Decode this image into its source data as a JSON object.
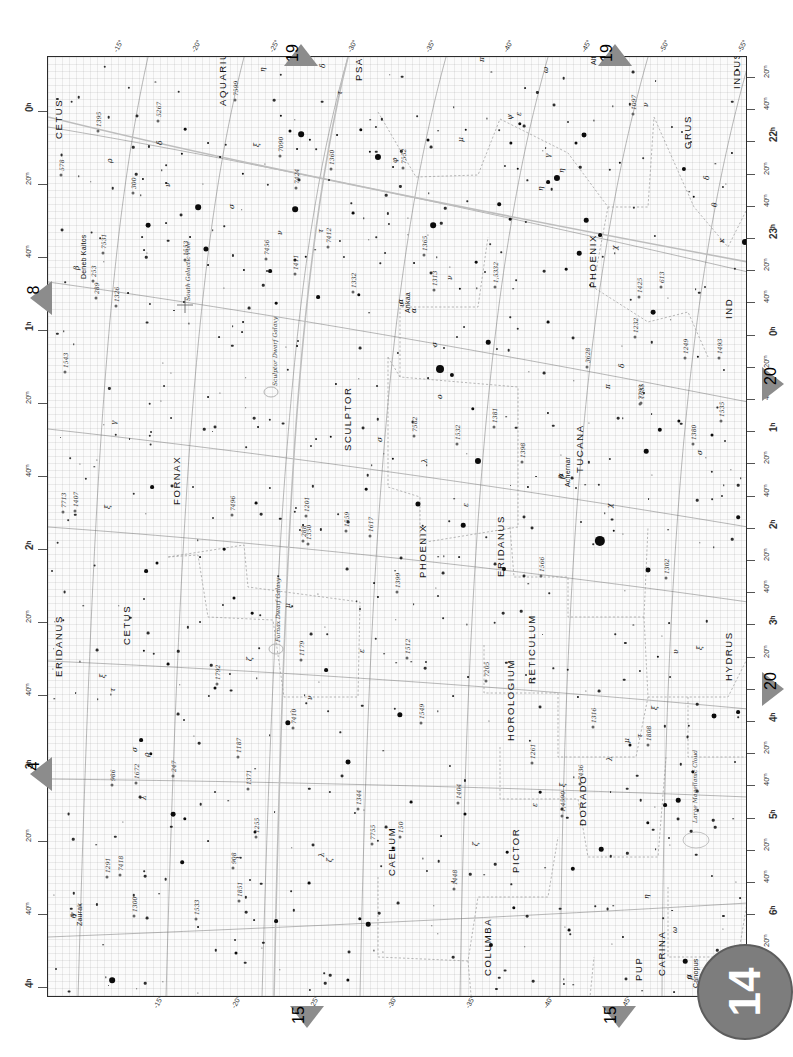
{
  "chart": {
    "page_number": "14",
    "type": "star-atlas-chart",
    "orientation_note": "labels rotated 90 degrees counter-clockwise",
    "frame": {
      "x": 47,
      "y": 56,
      "w": 700,
      "h": 941
    }
  },
  "axes": {
    "declination_label_top": [
      "-15°",
      "-20°",
      "-25°",
      "-30°",
      "-35°",
      "-40°",
      "-45°",
      "-50°",
      "-55°"
    ],
    "declination_label_bottom": [
      "-15°",
      "-20°",
      "-25°",
      "-30°",
      "-35°",
      "-40°",
      "-45°",
      "-50°",
      "-55°"
    ],
    "ra_left": [
      "0ʰ",
      "20ᵐ",
      "40ᵐ",
      "1ʰ",
      "20ᵐ",
      "40ᵐ",
      "2ʰ",
      "20ᵐ",
      "40ᵐ",
      "3ʰ",
      "20ᵐ",
      "40ᵐ",
      "4ʰ"
    ],
    "ra_right": [
      "20ᵐ",
      "40ᵐ",
      "22ʰ",
      "20ᵐ",
      "40ᵐ",
      "23ʰ",
      "20ᵐ",
      "40ᵐ",
      "0ʰ",
      "20ᵐ",
      "40ᵐ",
      "1ʰ",
      "20ᵐ",
      "40ᵐ",
      "2ʰ",
      "20ᵐ",
      "40ᵐ",
      "3ʰ",
      "20ᵐ",
      "40ᵐ",
      "4ʰ",
      "20ᵐ",
      "40ᵐ",
      "5ʰ",
      "20ᵐ",
      "40ᵐ",
      "6ʰ",
      "20ᵐ",
      "40ᵐ"
    ]
  },
  "adjacent_charts": [
    {
      "number": "19",
      "edge": "top",
      "x": 284,
      "y": 44
    },
    {
      "number": "19",
      "edge": "top",
      "x": 598,
      "y": 44
    },
    {
      "number": "8",
      "edge": "left",
      "x": 30,
      "y": 281
    },
    {
      "number": "4",
      "edge": "left",
      "x": 30,
      "y": 757
    },
    {
      "number": "20",
      "edge": "right",
      "x": 762,
      "y": 367
    },
    {
      "number": "20",
      "edge": "right",
      "x": 762,
      "y": 672
    },
    {
      "number": "15",
      "edge": "bottom",
      "x": 290,
      "y": 1006
    },
    {
      "number": "15",
      "edge": "bottom",
      "x": 602,
      "y": 1006
    }
  ],
  "constellations": [
    {
      "name": "CETUS",
      "x": 52,
      "y": 138
    },
    {
      "name": "AQUARIUS",
      "x": 216,
      "y": 105
    },
    {
      "name": "PSA",
      "x": 352,
      "y": 80
    },
    {
      "name": "GRUS",
      "x": 681,
      "y": 148
    },
    {
      "name": "INDUS",
      "x": 730,
      "y": 88
    },
    {
      "name": "PHOENIX",
      "x": 586,
      "y": 287
    },
    {
      "name": "IND",
      "x": 722,
      "y": 318
    },
    {
      "name": "SCULPTOR",
      "x": 341,
      "y": 450
    },
    {
      "name": "FORNAX",
      "x": 170,
      "y": 504
    },
    {
      "name": "TUCANA",
      "x": 573,
      "y": 472
    },
    {
      "name": "PHOENIX",
      "x": 416,
      "y": 577
    },
    {
      "name": "ERIDANUS",
      "x": 494,
      "y": 576
    },
    {
      "name": "CETUS",
      "x": 120,
      "y": 644
    },
    {
      "name": "ERIDANUS",
      "x": 52,
      "y": 676
    },
    {
      "name": "RETICULUM",
      "x": 525,
      "y": 683
    },
    {
      "name": "HYDRUS",
      "x": 722,
      "y": 680
    },
    {
      "name": "HOROLOGIUM",
      "x": 504,
      "y": 740
    },
    {
      "name": "CAELUM",
      "x": 385,
      "y": 875
    },
    {
      "name": "PICTOR",
      "x": 509,
      "y": 872
    },
    {
      "name": "DORADO",
      "x": 576,
      "y": 825
    },
    {
      "name": "COLUMBA",
      "x": 481,
      "y": 975
    },
    {
      "name": "PUP",
      "x": 632,
      "y": 980
    },
    {
      "name": "CARINA",
      "x": 655,
      "y": 975
    }
  ],
  "named_stars": [
    {
      "name": "Deneb Kaitos",
      "greek": "β",
      "x": 68,
      "y": 276
    },
    {
      "name": "Altair",
      "greek": "α",
      "x": 578,
      "y": 62
    },
    {
      "name": "Ankaa",
      "greek": "α",
      "x": 392,
      "y": 310
    },
    {
      "name": "Achernar",
      "greek": "α",
      "x": 552,
      "y": 484
    },
    {
      "name": "Zaurak",
      "greek": "γ",
      "x": 64,
      "y": 923
    },
    {
      "name": "Canopus",
      "greek": "α",
      "x": 680,
      "y": 985
    }
  ],
  "deep_sky": [
    {
      "label": "South Galactic Pole",
      "x": 183,
      "y": 300
    },
    {
      "label": "Sculptor Dwarf Galaxy",
      "x": 270,
      "y": 385
    },
    {
      "label": "Fornax Dwarf Galaxy",
      "x": 273,
      "y": 641
    },
    {
      "label": "Large Magellanic Cloud",
      "x": 690,
      "y": 822
    }
  ],
  "catalog_objects": [
    "7755",
    "7793",
    "1,5332",
    "7713",
    "253",
    "288",
    "150",
    "289",
    "300",
    "613",
    "578",
    "908",
    "986",
    "247",
    "7424",
    "7410",
    "7412",
    "7436",
    "7456",
    "5267",
    "1,4590",
    "7418",
    "7090",
    "7205",
    "3628",
    "7552",
    "7582",
    "7599",
    "7531",
    "7496",
    "1097",
    "1291",
    "1249",
    "1261",
    "1326",
    "1316",
    "1350",
    "1344",
    "1365",
    "1404",
    "1399",
    "1380",
    "1360",
    "1371",
    "1381",
    "1395",
    "1398",
    "1407",
    "1300",
    "1332",
    "1232",
    "1179",
    "1187",
    "1201",
    "1255",
    "1302",
    "1425",
    "1512",
    "1532",
    "1533",
    "1313",
    "1448",
    "1411",
    "1493",
    "1553",
    "1549",
    "1566",
    "1617",
    "1672",
    "1559",
    "1543",
    "1851",
    "1792",
    "1808",
    "1535",
    "1535"
  ],
  "greek_letters": [
    "α",
    "β",
    "γ",
    "δ",
    "ε",
    "ζ",
    "η",
    "θ",
    "ι",
    "κ",
    "λ",
    "μ",
    "ν",
    "ξ",
    "ο",
    "π",
    "ρ",
    "σ",
    "τ",
    "υ",
    "φ",
    "χ",
    "ψ",
    "ω"
  ],
  "star_field": [
    {
      "x": 233,
      "y": 59,
      "m": 1.2
    },
    {
      "x": 253,
      "y": 77,
      "m": 3.0
    },
    {
      "x": 242,
      "y": 74,
      "m": 1.6
    },
    {
      "x": 262,
      "y": 83,
      "m": 1.2
    },
    {
      "x": 249,
      "y": 92,
      "m": 1.0
    },
    {
      "x": 160,
      "y": 86,
      "m": 1.0
    },
    {
      "x": 172,
      "y": 100,
      "m": 1.0
    },
    {
      "x": 134,
      "y": 97,
      "m": 1.2
    },
    {
      "x": 137,
      "y": 72,
      "m": 1.4
    },
    {
      "x": 313,
      "y": 73,
      "m": 1.8
    },
    {
      "x": 322,
      "y": 95,
      "m": 1.2
    },
    {
      "x": 289,
      "y": 78,
      "m": 1.0
    },
    {
      "x": 195,
      "y": 117,
      "m": 1.2
    },
    {
      "x": 150,
      "y": 150,
      "m": 3.0
    },
    {
      "x": 100,
      "y": 168,
      "m": 2.5
    },
    {
      "x": 158,
      "y": 192,
      "m": 2.7
    },
    {
      "x": 118,
      "y": 126,
      "m": 1.0
    },
    {
      "x": 142,
      "y": 180,
      "m": 1.0
    },
    {
      "x": 95,
      "y": 122,
      "m": 1.1
    },
    {
      "x": 330,
      "y": 100,
      "m": 3.2
    },
    {
      "x": 345,
      "y": 110,
      "m": 1.0
    },
    {
      "x": 380,
      "y": 83,
      "m": 1.6
    },
    {
      "x": 418,
      "y": 73,
      "m": 1.3
    },
    {
      "x": 247,
      "y": 152,
      "m": 3.0
    },
    {
      "x": 305,
      "y": 156,
      "m": 1.5
    },
    {
      "x": 385,
      "y": 168,
      "m": 3.0
    },
    {
      "x": 472,
      "y": 67,
      "m": 1.8
    },
    {
      "x": 247,
      "y": 203,
      "m": 1.6
    },
    {
      "x": 258,
      "y": 200,
      "m": 1.3
    },
    {
      "x": 222,
      "y": 214,
      "m": 2.0
    },
    {
      "x": 160,
      "y": 208,
      "m": 1.0
    },
    {
      "x": 196,
      "y": 213,
      "m": 1.1
    },
    {
      "x": 228,
      "y": 246,
      "m": 1.4
    },
    {
      "x": 270,
      "y": 240,
      "m": 2.0
    },
    {
      "x": 311,
      "y": 238,
      "m": 1.8
    },
    {
      "x": 195,
      "y": 265,
      "m": 1.0
    },
    {
      "x": 536,
      "y": 78,
      "m": 2.6
    },
    {
      "x": 528,
      "y": 86,
      "m": 1.6
    },
    {
      "x": 572,
      "y": 106,
      "m": 1.2
    },
    {
      "x": 509,
      "y": 121,
      "m": 3.2
    },
    {
      "x": 500,
      "y": 125,
      "m": 2.0
    },
    {
      "x": 463,
      "y": 86,
      "m": 1.7
    },
    {
      "x": 470,
      "y": 112,
      "m": 1.3
    },
    {
      "x": 451,
      "y": 147,
      "m": 1.9
    },
    {
      "x": 462,
      "y": 162,
      "m": 1.4
    },
    {
      "x": 636,
      "y": 112,
      "m": 2.2
    },
    {
      "x": 646,
      "y": 140,
      "m": 1.3
    },
    {
      "x": 697,
      "y": 185,
      "m": 3.2
    },
    {
      "x": 705,
      "y": 212,
      "m": 2.0
    },
    {
      "x": 712,
      "y": 248,
      "m": 1.9
    },
    {
      "x": 684,
      "y": 96,
      "m": 1.1
    },
    {
      "x": 538,
      "y": 163,
      "m": 2.4
    },
    {
      "x": 552,
      "y": 178,
      "m": 2.0
    },
    {
      "x": 531,
      "y": 196,
      "m": 2.4
    },
    {
      "x": 518,
      "y": 212,
      "m": 1.4
    },
    {
      "x": 605,
      "y": 255,
      "m": 2.5
    },
    {
      "x": 500,
      "y": 265,
      "m": 1.5
    },
    {
      "x": 428,
      "y": 205,
      "m": 1.4
    },
    {
      "x": 412,
      "y": 232,
      "m": 1.2
    },
    {
      "x": 392,
      "y": 312,
      "m": 4.2
    },
    {
      "x": 404,
      "y": 318,
      "m": 2.2
    },
    {
      "x": 440,
      "y": 285,
      "m": 2.4
    },
    {
      "x": 425,
      "y": 352,
      "m": 1.8
    },
    {
      "x": 430,
      "y": 404,
      "m": 3.2
    },
    {
      "x": 370,
      "y": 447,
      "m": 2.7
    },
    {
      "x": 415,
      "y": 468,
      "m": 2.4
    },
    {
      "x": 456,
      "y": 512,
      "m": 2.1
    },
    {
      "x": 552,
      "y": 484,
      "m": 5.4
    },
    {
      "x": 566,
      "y": 474,
      "m": 1.3
    },
    {
      "x": 598,
      "y": 394,
      "m": 2.4
    },
    {
      "x": 612,
      "y": 373,
      "m": 2.3
    },
    {
      "x": 631,
      "y": 364,
      "m": 1.7
    },
    {
      "x": 664,
      "y": 378,
      "m": 1.6
    },
    {
      "x": 600,
      "y": 513,
      "m": 2.6
    },
    {
      "x": 690,
      "y": 460,
      "m": 1.9
    },
    {
      "x": 345,
      "y": 402,
      "m": 1.2
    },
    {
      "x": 318,
      "y": 432,
      "m": 1.4
    },
    {
      "x": 283,
      "y": 380,
      "m": 1.3
    },
    {
      "x": 208,
      "y": 446,
      "m": 1.5
    },
    {
      "x": 176,
      "y": 492,
      "m": 1.4
    },
    {
      "x": 104,
      "y": 430,
      "m": 2.0
    },
    {
      "x": 98,
      "y": 514,
      "m": 2.0
    },
    {
      "x": 109,
      "y": 506,
      "m": 1.6
    },
    {
      "x": 186,
      "y": 541,
      "m": 1.6
    },
    {
      "x": 204,
      "y": 556,
      "m": 1.4
    },
    {
      "x": 96,
      "y": 594,
      "m": 1.2
    },
    {
      "x": 120,
      "y": 607,
      "m": 1.5
    },
    {
      "x": 167,
      "y": 631,
      "m": 1.6
    },
    {
      "x": 240,
      "y": 666,
      "m": 2.8
    },
    {
      "x": 278,
      "y": 613,
      "m": 2.0
    },
    {
      "x": 352,
      "y": 658,
      "m": 2.8
    },
    {
      "x": 300,
      "y": 705,
      "m": 2.6
    },
    {
      "x": 93,
      "y": 683,
      "m": 2.0
    },
    {
      "x": 103,
      "y": 697,
      "m": 1.8
    },
    {
      "x": 125,
      "y": 757,
      "m": 2.5
    },
    {
      "x": 137,
      "y": 762,
      "m": 1.8
    },
    {
      "x": 134,
      "y": 805,
      "m": 1.9
    },
    {
      "x": 207,
      "y": 775,
      "m": 1.6
    },
    {
      "x": 188,
      "y": 896,
      "m": 1.6
    },
    {
      "x": 64,
      "y": 923,
      "m": 3.0
    },
    {
      "x": 228,
      "y": 864,
      "m": 2.0
    },
    {
      "x": 320,
      "y": 867,
      "m": 2.4
    },
    {
      "x": 312,
      "y": 862,
      "m": 1.8
    },
    {
      "x": 300,
      "y": 923,
      "m": 1.7
    },
    {
      "x": 443,
      "y": 888,
      "m": 2.2
    },
    {
      "x": 466,
      "y": 851,
      "m": 1.8
    },
    {
      "x": 525,
      "y": 812,
      "m": 2.3
    },
    {
      "x": 553,
      "y": 792,
      "m": 2.4
    },
    {
      "x": 617,
      "y": 748,
      "m": 2.0
    },
    {
      "x": 630,
      "y": 743,
      "m": 2.4
    },
    {
      "x": 645,
      "y": 715,
      "m": 1.8
    },
    {
      "x": 666,
      "y": 659,
      "m": 2.6
    },
    {
      "x": 690,
      "y": 655,
      "m": 2.0
    },
    {
      "x": 637,
      "y": 904,
      "m": 2.4
    },
    {
      "x": 680,
      "y": 985,
      "m": 4.0
    },
    {
      "x": 665,
      "y": 938,
      "m": 2.2
    },
    {
      "x": 600,
      "y": 766,
      "m": 1.8
    },
    {
      "x": 582,
      "y": 688,
      "m": 1.6
    },
    {
      "x": 492,
      "y": 735,
      "m": 1.4
    },
    {
      "x": 261,
      "y": 826,
      "m": 1.5
    },
    {
      "x": 345,
      "y": 791,
      "m": 1.6
    },
    {
      "x": 363,
      "y": 745,
      "m": 1.5
    },
    {
      "x": 417,
      "y": 757,
      "m": 1.6
    },
    {
      "x": 459,
      "y": 795,
      "m": 1.4
    },
    {
      "x": 521,
      "y": 873,
      "m": 1.5
    },
    {
      "x": 80,
      "y": 236,
      "m": 1.0
    },
    {
      "x": 288,
      "y": 327,
      "m": 1.1
    },
    {
      "x": 249,
      "y": 289,
      "m": 1.0
    },
    {
      "x": 366,
      "y": 206,
      "m": 1.0
    },
    {
      "x": 650,
      "y": 300,
      "m": 1.2
    },
    {
      "x": 596,
      "y": 336,
      "m": 1.1
    },
    {
      "x": 480,
      "y": 430,
      "m": 1.1
    },
    {
      "x": 500,
      "y": 356,
      "m": 1.1
    },
    {
      "x": 330,
      "y": 540,
      "m": 1.1
    },
    {
      "x": 255,
      "y": 468,
      "m": 1.0
    },
    {
      "x": 610,
      "y": 600,
      "m": 1.2
    },
    {
      "x": 700,
      "y": 545,
      "m": 1.1
    },
    {
      "x": 420,
      "y": 620,
      "m": 1.0
    },
    {
      "x": 530,
      "y": 640,
      "m": 1.1
    },
    {
      "x": 160,
      "y": 340,
      "m": 1.0
    },
    {
      "x": 210,
      "y": 370,
      "m": 1.0
    },
    {
      "x": 575,
      "y": 880,
      "m": 1.1
    },
    {
      "x": 420,
      "y": 950,
      "m": 1.0
    },
    {
      "x": 240,
      "y": 960,
      "m": 1.0
    },
    {
      "x": 150,
      "y": 870,
      "m": 1.0
    }
  ]
}
